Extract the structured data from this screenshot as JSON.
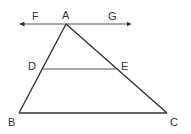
{
  "diagram": {
    "type": "geometry",
    "points": {
      "A": {
        "x": 66,
        "y": 24
      },
      "B": {
        "x": 19,
        "y": 113
      },
      "C": {
        "x": 167,
        "y": 113
      },
      "D": {
        "x": 43,
        "y": 69
      },
      "E": {
        "x": 116,
        "y": 69
      },
      "F_end": {
        "x": 17,
        "y": 24
      },
      "G_end": {
        "x": 134,
        "y": 24
      }
    },
    "labels": {
      "F": "F",
      "A": "A",
      "G": "G",
      "D": "D",
      "E": "E",
      "B": "B",
      "C": "C"
    },
    "segments": [
      "AB",
      "AC",
      "BC",
      "DE"
    ],
    "lines": [
      "FG (double-headed arrow through A)"
    ],
    "colors": {
      "stroke": "#333333",
      "background": "#ffffff"
    }
  }
}
